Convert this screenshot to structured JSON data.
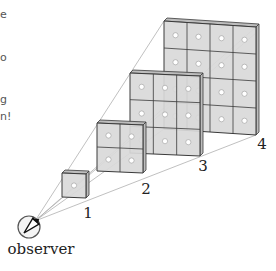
{
  "diagram": {
    "type": "perspective-projection",
    "colors": {
      "background": "#ffffff",
      "square_fill": "#d9d9d9",
      "square_edge": "#3a3a3a",
      "side_fill": "#bdbdbd",
      "dot_fill": "#ffffff",
      "dot_stroke": "#9a9a9a",
      "ray": "#b0b0b0",
      "label": "#222222"
    },
    "observer": {
      "label": "observer",
      "cx": 29,
      "cy": 227,
      "r": 11,
      "icon": "eye-view-cone-icon"
    },
    "squares": [
      {
        "id": 1,
        "label": "1",
        "grid": 1,
        "x": 62,
        "y": 173,
        "w": 24,
        "h": 24,
        "skew": 1,
        "depth": 3,
        "label_x": 88,
        "label_y": 218
      },
      {
        "id": 2,
        "label": "2",
        "grid": 2,
        "x": 97,
        "y": 123,
        "w": 46,
        "h": 48,
        "skew": 2,
        "depth": 3,
        "label_x": 146,
        "label_y": 194
      },
      {
        "id": 3,
        "label": "3",
        "grid": 3,
        "x": 130,
        "y": 73,
        "w": 70,
        "h": 80,
        "skew": 3,
        "depth": 3,
        "label_x": 203,
        "label_y": 171
      },
      {
        "id": 4,
        "label": "4",
        "grid": 4,
        "x": 164,
        "y": 21,
        "w": 92,
        "h": 108,
        "skew": 6,
        "depth": 3,
        "label_x": 262,
        "label_y": 149
      }
    ]
  },
  "left_text_fragments": [
    {
      "text": "e",
      "x": 0,
      "y": 9
    },
    {
      "text": "o",
      "x": 0,
      "y": 52
    },
    {
      "text": "g",
      "x": 0,
      "y": 94
    },
    {
      "text": "n!",
      "x": 0,
      "y": 111
    }
  ]
}
